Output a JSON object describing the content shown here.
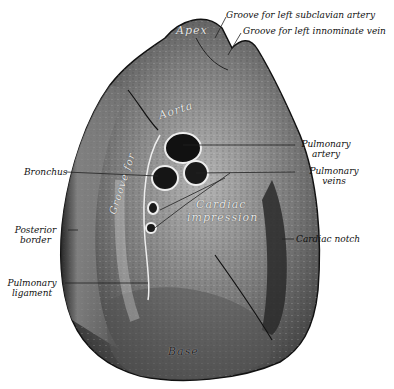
{
  "figure": {
    "colors": {
      "background": "#ffffff",
      "lung_dark": "#2a2a2a",
      "lung_mid": "#6e6e6e",
      "lung_light": "#b8b8b8",
      "label_text": "#111111",
      "leader_line": "#222222"
    }
  },
  "labels": {
    "groove_subclavian": "Groove for left subclavian artery",
    "groove_innominate": "Groove for left innominate vein",
    "pulmonary_artery_1": "Pulmonary",
    "pulmonary_artery_2": "artery",
    "pulmonary_veins_1": "Pulmonary",
    "pulmonary_veins_2": "veins",
    "bronchus": "Bronchus",
    "posterior_border_1": "Posterior",
    "posterior_border_2": "border",
    "cardiac_notch": "Cardiac notch",
    "pulmonary_ligament_1": "Pulmonary",
    "pulmonary_ligament_2": "ligament"
  },
  "inner_labels": {
    "apex": "Apex",
    "aorta": "Aorta",
    "groove_for": "Groove for",
    "cardiac": "Cardiac",
    "impression": "impression",
    "base": "Base"
  }
}
